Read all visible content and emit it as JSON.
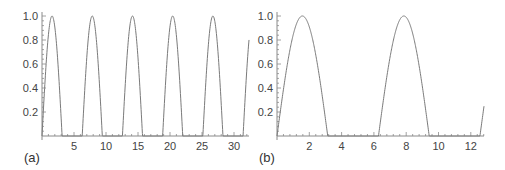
{
  "figure": {
    "axis_color": "#8a8a8a",
    "curve_color": "#7a7a7a",
    "text_color": "#444444"
  },
  "chart_data": [
    {
      "type": "line",
      "panel_label": "(a)",
      "title": "",
      "xlabel": "",
      "ylabel": "",
      "function": "max(sin(x), 0)",
      "xlim": [
        0,
        32
      ],
      "ylim": [
        0,
        1.0
      ],
      "x_ticks": [
        5,
        10,
        15,
        20,
        25,
        30
      ],
      "x_tick_labels": [
        "5",
        "10",
        "15",
        "20",
        "25",
        "30"
      ],
      "y_ticks": [
        0.2,
        0.4,
        0.6,
        0.8,
        1.0
      ],
      "y_tick_labels": [
        "0.2",
        "0.4",
        "0.6",
        "0.8",
        "1.0"
      ],
      "grid": false,
      "legend": null,
      "peaks": [
        {
          "x": 1.57,
          "y": 1.0
        },
        {
          "x": 7.85,
          "y": 1.0
        },
        {
          "x": 14.14,
          "y": 1.0
        },
        {
          "x": 20.42,
          "y": 1.0
        },
        {
          "x": 26.7,
          "y": 1.0
        }
      ],
      "zero_intervals": [
        [
          3.14,
          6.28
        ],
        [
          9.42,
          12.57
        ],
        [
          15.71,
          18.85
        ],
        [
          21.99,
          25.13
        ],
        [
          28.27,
          31.42
        ]
      ],
      "layout": {
        "left": 42,
        "right": 249,
        "top": 16,
        "bottom": 136,
        "x_per_unit": 6.4,
        "label_x": 24,
        "label_y": 162
      }
    },
    {
      "type": "line",
      "panel_label": "(b)",
      "title": "",
      "xlabel": "",
      "ylabel": "",
      "function": "max(sin(x), 0)",
      "xlim": [
        0,
        12.9
      ],
      "ylim": [
        0,
        1.0
      ],
      "x_ticks": [
        2,
        4,
        6,
        8,
        10,
        12
      ],
      "x_tick_labels": [
        "2",
        "4",
        "6",
        "8",
        "10",
        "12"
      ],
      "y_ticks": [
        0.2,
        0.4,
        0.6,
        0.8,
        1.0
      ],
      "y_tick_labels": [
        "0.2",
        "0.4",
        "0.6",
        "0.8",
        "1.0"
      ],
      "grid": false,
      "legend": null,
      "peaks": [
        {
          "x": 1.57,
          "y": 1.0
        },
        {
          "x": 7.85,
          "y": 1.0
        }
      ],
      "zero_intervals": [
        [
          3.14,
          6.28
        ],
        [
          9.42,
          12.9
        ]
      ],
      "layout": {
        "left": 277,
        "right": 484,
        "top": 16,
        "bottom": 136,
        "x_per_unit": 16.15,
        "label_x": 259,
        "label_y": 162
      }
    }
  ]
}
